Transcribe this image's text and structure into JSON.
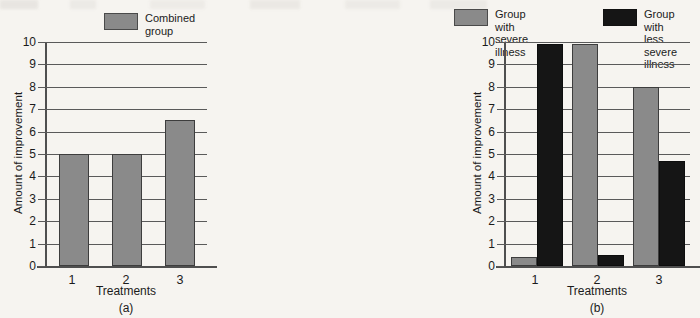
{
  "figure": {
    "background_color": "#f6f4f0",
    "gray_color": "#8a8a8a",
    "black_color": "#151515"
  },
  "chart_data": [
    {
      "type": "bar",
      "panel": "a",
      "caption": "(a)",
      "title": "",
      "xlabel": "Treatments",
      "ylabel": "Amount of improvement",
      "categories": [
        "1",
        "2",
        "3"
      ],
      "ylim": [
        0,
        10
      ],
      "yticks": [
        0,
        1,
        2,
        3,
        4,
        5,
        6,
        7,
        8,
        9,
        10
      ],
      "ytick_labels": [
        "0",
        "1",
        "2",
        "3",
        "4",
        "5",
        "6",
        "7",
        "8",
        "9",
        "10"
      ],
      "grid": true,
      "legend_position": "top-center",
      "series": [
        {
          "name": "Combined\ngroup",
          "legend_label_line1": "Combined",
          "legend_label_line2": "group",
          "color": "#8a8a8a",
          "values": [
            5.0,
            5.0,
            6.5
          ]
        }
      ]
    },
    {
      "type": "bar",
      "panel": "b",
      "caption": "(b)",
      "title": "",
      "xlabel": "Treatments",
      "ylabel": "Amount of improvement",
      "categories": [
        "1",
        "2",
        "3"
      ],
      "ylim": [
        0,
        10
      ],
      "yticks": [
        0,
        1,
        2,
        3,
        4,
        5,
        6,
        7,
        8,
        9,
        10
      ],
      "ytick_labels": [
        "0",
        "1",
        "2",
        "3",
        "4",
        "5",
        "6",
        "7",
        "8",
        "9",
        "10"
      ],
      "grid": true,
      "legend_position": "top",
      "series": [
        {
          "name": "Group with\nsevere illness",
          "legend_label_line1": "Group with",
          "legend_label_line2": "severe illness",
          "color": "#8a8a8a",
          "values": [
            0.4,
            9.9,
            8.0
          ]
        },
        {
          "name": "Group with less\nsevere illness",
          "legend_label_line1": "Group with less",
          "legend_label_line2": "severe illness",
          "color": "#151515",
          "values": [
            9.9,
            0.5,
            4.7
          ]
        }
      ]
    }
  ]
}
